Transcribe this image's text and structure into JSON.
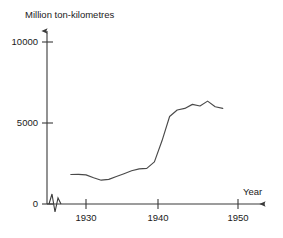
{
  "chart_data": {
    "type": "line",
    "title": "",
    "subtitle": "",
    "ylabel": "Million ton-kilometres",
    "xlabel": "Year",
    "xlim": [
      1927,
      1951
    ],
    "ylim": [
      0,
      10000
    ],
    "grid": false,
    "legend": false,
    "axis_break": "x-axis zigzag break between origin and first data",
    "y_ticks": [
      {
        "value": 0,
        "label": "0"
      },
      {
        "value": 5000,
        "label": "5000"
      },
      {
        "value": 10000,
        "label": "10000"
      }
    ],
    "x_ticks": [
      {
        "value": 1930,
        "label": "1930"
      },
      {
        "value": 1940,
        "label": "1940"
      },
      {
        "value": 1950,
        "label": "1950"
      }
    ],
    "series": [
      {
        "name": "Freight traffic",
        "color": "#4a4a4a",
        "x": [
          1928,
          1929,
          1930,
          1931,
          1932,
          1933,
          1934,
          1935,
          1936,
          1937,
          1938,
          1939,
          1940,
          1941,
          1942,
          1943,
          1944,
          1945,
          1946,
          1947,
          1948
        ],
        "values": [
          1820,
          1830,
          1800,
          1620,
          1470,
          1520,
          1700,
          1870,
          2050,
          2170,
          2200,
          2600,
          3900,
          5400,
          5800,
          5900,
          6150,
          6050,
          6350,
          6000,
          5900
        ]
      }
    ]
  },
  "axes": {
    "y_axis_title": "Million ton-kilometres",
    "x_axis_title": "Year"
  }
}
